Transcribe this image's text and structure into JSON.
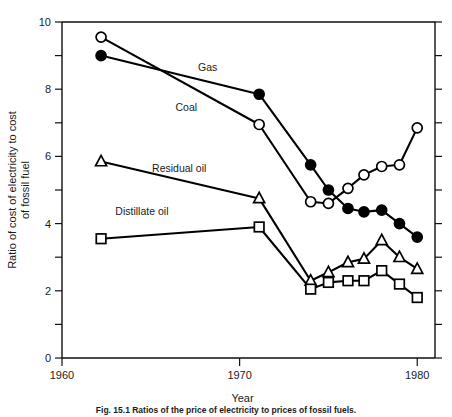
{
  "figure": {
    "caption": "Fig. 15.1  Ratios of the price of electricity to prices of fossil fuels.",
    "background_color": "#ffffff",
    "ink_color": "#000000"
  },
  "chart_data": {
    "type": "line",
    "title": "",
    "xlabel": "Year",
    "ylabel": "Ratio of cost of electricity to cost of fossil fuel",
    "xlim": [
      1960,
      1981
    ],
    "ylim": [
      0,
      10
    ],
    "x_ticks": [
      1960,
      1970,
      1980
    ],
    "x_tick_labels": [
      "1960",
      "1970",
      "1980"
    ],
    "y_ticks": [
      0,
      2,
      4,
      6,
      8,
      10
    ],
    "y_tick_labels": [
      "0",
      "2",
      "4",
      "6",
      "8",
      "10"
    ],
    "y_minor_ticks": [
      1,
      3,
      5,
      7,
      9
    ],
    "grid": false,
    "legend_position": "inline-annotations",
    "annotations": [
      {
        "text": "Gas",
        "x": 1968.2,
        "y": 8.55
      },
      {
        "text": "Coal",
        "x": 1967.0,
        "y": 7.35
      },
      {
        "text": "Residual oil",
        "x": 1966.6,
        "y": 5.55
      },
      {
        "text": "Distillate oil",
        "x": 1964.5,
        "y": 4.25
      }
    ],
    "series": [
      {
        "name": "Coal",
        "marker": "open-circle",
        "x": [
          1962.2,
          1971.1,
          1974.0,
          1975.0,
          1976.1,
          1977.0,
          1978.0,
          1979.0,
          1980.0
        ],
        "values": [
          9.55,
          6.95,
          4.65,
          4.6,
          5.05,
          5.45,
          5.7,
          5.75,
          6.85
        ]
      },
      {
        "name": "Gas",
        "marker": "filled-circle",
        "x": [
          1962.2,
          1971.1,
          1974.0,
          1975.0,
          1976.1,
          1977.0,
          1978.0,
          1979.0,
          1980.0
        ],
        "values": [
          9.0,
          7.85,
          5.75,
          5.0,
          4.45,
          4.35,
          4.4,
          4.0,
          3.6
        ]
      },
      {
        "name": "Residual oil",
        "marker": "open-triangle",
        "x": [
          1962.2,
          1971.1,
          1974.0,
          1975.0,
          1976.1,
          1977.0,
          1978.0,
          1979.0,
          1980.0
        ],
        "values": [
          5.85,
          4.75,
          2.3,
          2.55,
          2.85,
          2.95,
          3.5,
          3.0,
          2.65
        ]
      },
      {
        "name": "Distillate oil",
        "marker": "open-square",
        "x": [
          1962.2,
          1971.1,
          1974.0,
          1975.0,
          1976.1,
          1977.0,
          1978.0,
          1979.0,
          1980.0
        ],
        "values": [
          3.55,
          3.9,
          2.05,
          2.25,
          2.3,
          2.3,
          2.6,
          2.2,
          1.8
        ]
      }
    ]
  }
}
